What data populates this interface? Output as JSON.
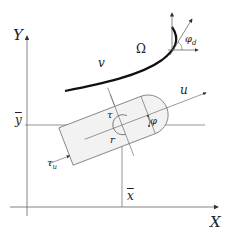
{
  "diagram": {
    "type": "robot-kinematics-frame",
    "axes": {
      "x_label": "X",
      "y_label": "Y",
      "x_bar_label": "x",
      "y_bar_label": "y"
    },
    "labels": {
      "path": "v",
      "region": "Ω",
      "heading_axis": "u",
      "angle": "φ",
      "desired_angle": "φ",
      "desired_angle_sub": "d",
      "radius": "r",
      "torque_top": "τ",
      "torque_side": "τ",
      "torque_side_sub": "u"
    },
    "colors": {
      "stroke": "#555555",
      "curve": "#111111",
      "body_fill": "#f2f2f2",
      "text": "#222222"
    }
  }
}
